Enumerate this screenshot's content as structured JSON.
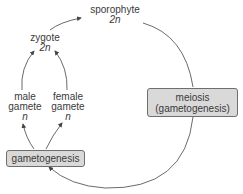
{
  "nodes": {
    "sporophyte": {
      "name": "sporophyte",
      "ploidy": "2n"
    },
    "zygote": {
      "name": "zygote",
      "ploidy": "2n"
    },
    "male_gamete": {
      "line1": "male",
      "line2": "gamete",
      "ploidy": "n"
    },
    "female_gamete": {
      "line1": "female",
      "line2": "gamete",
      "ploidy": "n"
    },
    "meiosis": {
      "line1": "meiosis",
      "line2": "(gametogenesis)"
    },
    "gametogenesis": {
      "label": "gametogenesis"
    }
  },
  "colors": {
    "box_fill": "#d9d9d9",
    "box_border": "#6e6e6e",
    "line": "#444444",
    "text": "#3a3a3a"
  }
}
